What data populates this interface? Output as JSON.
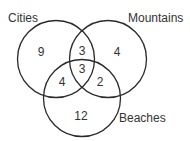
{
  "diagram": {
    "type": "venn",
    "sets": [
      {
        "name": "Cities",
        "only": "9"
      },
      {
        "name": "Mountains",
        "only": "4"
      },
      {
        "name": "Beaches",
        "only": "12"
      }
    ],
    "labels": {
      "cities": "Cities",
      "mountains": "Mountains",
      "beaches": "Beaches"
    },
    "regions": {
      "cities_only": "9",
      "mountains_only": "4",
      "beaches_only": "12",
      "cities_mountains": "3",
      "cities_beaches": "4",
      "mountains_beaches": "2",
      "all_three": "3"
    },
    "colors": {
      "stroke": "#2a2a2a",
      "text": "#333333",
      "background": "#ffffff"
    }
  }
}
